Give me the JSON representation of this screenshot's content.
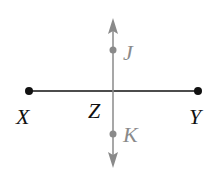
{
  "diagram": {
    "type": "geometry-perpendicular-lines",
    "colors": {
      "segment": "#111111",
      "line": "#8a8a8a",
      "black_label": "#111111",
      "gray_label": "#8a8a8a"
    },
    "points": {
      "X": {
        "label": "X",
        "x": 29,
        "y": 91
      },
      "Y": {
        "label": "Y",
        "x": 198,
        "y": 91
      },
      "Z": {
        "label": "Z",
        "x": 113,
        "y": 91
      },
      "J": {
        "label": "J",
        "x": 113,
        "y": 50
      },
      "K": {
        "label": "K",
        "x": 113,
        "y": 134
      }
    },
    "segment_XY": {
      "from": "X",
      "to": "Y"
    },
    "line_JK": {
      "through": [
        "J",
        "K"
      ],
      "arrows": "both"
    }
  }
}
